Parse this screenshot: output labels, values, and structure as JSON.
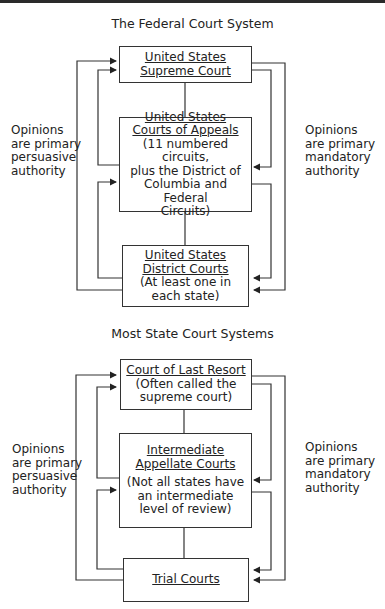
{
  "federal": {
    "title": "The Federal Court System",
    "supreme": {
      "line1": "United States",
      "line2": "Supreme Court"
    },
    "appeals": {
      "line1": "United States",
      "line2": "Courts of Appeals",
      "note1": "(11 numbered circuits,",
      "note2": "plus the District of",
      "note3": "Columbia and Federal",
      "note4": "Circuits)"
    },
    "district": {
      "line1": "United States",
      "line2": "District Courts",
      "note1": "(At least one in",
      "note2": "each state)"
    },
    "left_label": {
      "line1": "Opinions",
      "line2": "are primary",
      "line3": "persuasive",
      "line4": "authority"
    },
    "right_label": {
      "line1": "Opinions",
      "line2": "are primary",
      "line3": "mandatory",
      "line4": "authority"
    }
  },
  "state": {
    "title": "Most State Court Systems",
    "last_resort": {
      "line1": "Court of Last Resort",
      "note1": "(Often called the",
      "note2": "supreme court)"
    },
    "intermediate": {
      "line1": "Intermediate",
      "line2": "Appellate Courts",
      "note1": "(Not all states have",
      "note2": "an intermediate",
      "note3": "level of review)"
    },
    "trial": {
      "line1": "Trial Courts"
    },
    "left_label": {
      "line1": "Opinions",
      "line2": "are primary",
      "line3": "persuasive",
      "line4": "authority"
    },
    "right_label": {
      "line1": "Opinions",
      "line2": "are primary",
      "line3": "mandatory",
      "line4": "authority"
    }
  },
  "colors": {
    "line": "#333333",
    "background": "#ffffff"
  }
}
